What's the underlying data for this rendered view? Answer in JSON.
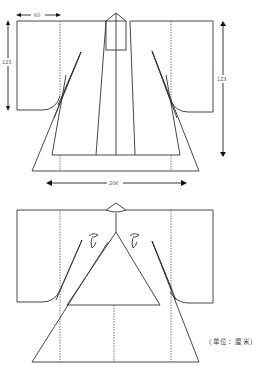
{
  "figure": {
    "front_view": {
      "dimensions": {
        "sleeve_width": "60",
        "sleeve_length_left": "123",
        "garment_length_right": "123",
        "hem_width": "206"
      }
    },
    "back_view": {
      "ornament": "triangle-motif",
      "collar": "diamond-collar"
    },
    "unit_note": "（单位：厘米）"
  },
  "colors": {
    "line": "#333333",
    "background": "#ffffff"
  }
}
